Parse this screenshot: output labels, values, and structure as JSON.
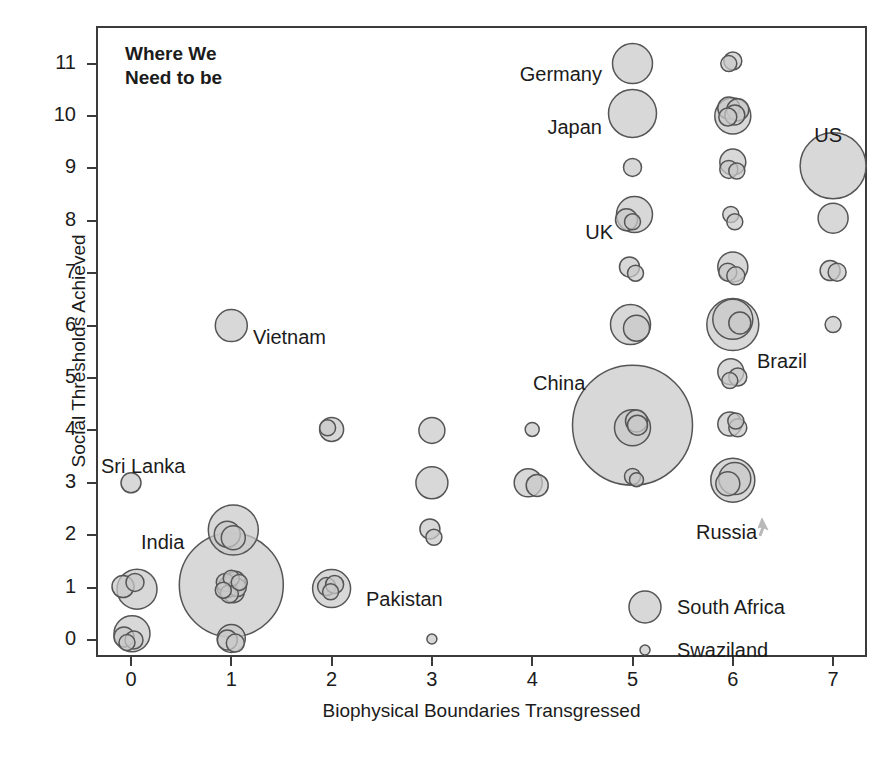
{
  "chart_data": {
    "type": "scatter",
    "title": "",
    "xlabel": "Biophysical Boundaries Transgressed",
    "ylabel": "Social Thresholds Achieved",
    "xlim": [
      -0.35,
      7.35
    ],
    "ylim": [
      -0.55,
      11.6
    ],
    "xticks": [
      0,
      1,
      2,
      3,
      4,
      5,
      6,
      7
    ],
    "yticks": [
      0,
      1,
      2,
      3,
      4,
      5,
      6,
      7,
      8,
      9,
      10,
      11
    ],
    "grid": false,
    "legend_position": "inside-bottom-right",
    "size_encoding": "population",
    "marker_fill": "#c9c9c9",
    "marker_stroke": "#555555",
    "marker_opacity": 0.72,
    "points": [
      {
        "label": "Sri Lanka",
        "x": 0,
        "y": 3,
        "r": 10
      },
      {
        "label": "",
        "x": -0.08,
        "y": 1.02,
        "r": 11
      },
      {
        "label": "",
        "x": 0.04,
        "y": 1.1,
        "r": 9
      },
      {
        "label": "",
        "x": 0.06,
        "y": 0.97,
        "r": 20
      },
      {
        "label": "",
        "x": -0.07,
        "y": 0.06,
        "r": 10
      },
      {
        "label": "",
        "x": 0.03,
        "y": 0.0,
        "r": 9
      },
      {
        "label": "",
        "x": 0.01,
        "y": 0.12,
        "r": 18
      },
      {
        "label": "",
        "x": -0.04,
        "y": -0.05,
        "r": 8
      },
      {
        "label": "Vietnam",
        "x": 1,
        "y": 6,
        "r": 16
      },
      {
        "label": "",
        "x": 1.02,
        "y": 2.1,
        "r": 25
      },
      {
        "label": "",
        "x": 0.96,
        "y": 2.02,
        "r": 13
      },
      {
        "label": "",
        "x": 1.02,
        "y": 1.95,
        "r": 12
      },
      {
        "label": "India",
        "x": 1.0,
        "y": 1.05,
        "r": 52
      },
      {
        "label": "",
        "x": 1.0,
        "y": 1.05,
        "r": 11
      },
      {
        "label": "",
        "x": 1.04,
        "y": 1.12,
        "r": 10
      },
      {
        "label": "",
        "x": 0.96,
        "y": 1.0,
        "r": 10
      },
      {
        "label": "",
        "x": 1.02,
        "y": 0.92,
        "r": 11
      },
      {
        "label": "",
        "x": 0.94,
        "y": 1.1,
        "r": 9
      },
      {
        "label": "",
        "x": 1.06,
        "y": 1.0,
        "r": 9
      },
      {
        "label": "",
        "x": 1.0,
        "y": 1.18,
        "r": 8
      },
      {
        "label": "",
        "x": 0.98,
        "y": 0.88,
        "r": 9
      },
      {
        "label": "",
        "x": 1.08,
        "y": 1.1,
        "r": 8
      },
      {
        "label": "",
        "x": 0.92,
        "y": 0.95,
        "r": 8
      },
      {
        "label": "",
        "x": 1.0,
        "y": 0.03,
        "r": 14
      },
      {
        "label": "",
        "x": 0.96,
        "y": 0.0,
        "r": 10
      },
      {
        "label": "",
        "x": 1.04,
        "y": -0.06,
        "r": 9
      },
      {
        "label": "",
        "x": 2,
        "y": 4.02,
        "r": 12
      },
      {
        "label": "",
        "x": 1.96,
        "y": 4.05,
        "r": 8
      },
      {
        "label": "Pakistan",
        "x": 2.0,
        "y": 0.98,
        "r": 19
      },
      {
        "label": "",
        "x": 1.95,
        "y": 1.02,
        "r": 9
      },
      {
        "label": "",
        "x": 2.03,
        "y": 1.06,
        "r": 9
      },
      {
        "label": "",
        "x": 1.99,
        "y": 0.92,
        "r": 8
      },
      {
        "label": "",
        "x": 3,
        "y": 4.0,
        "r": 13
      },
      {
        "label": "",
        "x": 3,
        "y": 3.0,
        "r": 16
      },
      {
        "label": "",
        "x": 2.98,
        "y": 2.12,
        "r": 10
      },
      {
        "label": "",
        "x": 3.02,
        "y": 1.96,
        "r": 8
      },
      {
        "label": "",
        "x": 3,
        "y": 0.02,
        "r": 5
      },
      {
        "label": "",
        "x": 4,
        "y": 4.02,
        "r": 7
      },
      {
        "label": "",
        "x": 3.96,
        "y": 3.0,
        "r": 14
      },
      {
        "label": "",
        "x": 4.05,
        "y": 2.95,
        "r": 11
      },
      {
        "label": "Germany",
        "x": 5,
        "y": 11.0,
        "r": 20
      },
      {
        "label": "Japan",
        "x": 5,
        "y": 10.05,
        "r": 24
      },
      {
        "label": "",
        "x": 5,
        "y": 9.02,
        "r": 9
      },
      {
        "label": "UK",
        "x": 5.02,
        "y": 8.12,
        "r": 18
      },
      {
        "label": "",
        "x": 4.94,
        "y": 8.02,
        "r": 11
      },
      {
        "label": "",
        "x": 5.0,
        "y": 7.98,
        "r": 8
      },
      {
        "label": "",
        "x": 4.97,
        "y": 7.12,
        "r": 10
      },
      {
        "label": "",
        "x": 5.03,
        "y": 7.0,
        "r": 8
      },
      {
        "label": "",
        "x": 4.98,
        "y": 6.02,
        "r": 20
      },
      {
        "label": "",
        "x": 5.04,
        "y": 5.95,
        "r": 13
      },
      {
        "label": "China",
        "x": 5.0,
        "y": 4.1,
        "r": 60
      },
      {
        "label": "",
        "x": 5.0,
        "y": 4.05,
        "r": 18
      },
      {
        "label": "",
        "x": 5.04,
        "y": 4.18,
        "r": 11
      },
      {
        "label": "",
        "x": 5.05,
        "y": 4.1,
        "r": 10
      },
      {
        "label": "",
        "x": 5.0,
        "y": 3.12,
        "r": 8
      },
      {
        "label": "",
        "x": 5.04,
        "y": 3.06,
        "r": 7
      },
      {
        "label": "",
        "x": 6.0,
        "y": 11.05,
        "r": 9
      },
      {
        "label": "",
        "x": 5.96,
        "y": 11.0,
        "r": 8
      },
      {
        "label": "",
        "x": 6.0,
        "y": 10.0,
        "r": 18
      },
      {
        "label": "",
        "x": 5.96,
        "y": 10.15,
        "r": 11
      },
      {
        "label": "",
        "x": 6.05,
        "y": 10.12,
        "r": 11
      },
      {
        "label": "",
        "x": 6.02,
        "y": 10.02,
        "r": 10
      },
      {
        "label": "",
        "x": 5.95,
        "y": 9.98,
        "r": 9
      },
      {
        "label": "",
        "x": 6.0,
        "y": 9.12,
        "r": 13
      },
      {
        "label": "",
        "x": 5.96,
        "y": 8.98,
        "r": 9
      },
      {
        "label": "",
        "x": 6.04,
        "y": 8.95,
        "r": 8
      },
      {
        "label": "",
        "x": 5.98,
        "y": 8.12,
        "r": 8
      },
      {
        "label": "",
        "x": 6.02,
        "y": 7.98,
        "r": 8
      },
      {
        "label": "",
        "x": 6.0,
        "y": 7.12,
        "r": 15
      },
      {
        "label": "",
        "x": 5.95,
        "y": 7.02,
        "r": 9
      },
      {
        "label": "",
        "x": 6.03,
        "y": 6.95,
        "r": 9
      },
      {
        "label": "Brazil",
        "x": 6.0,
        "y": 6.02,
        "r": 26
      },
      {
        "label": "",
        "x": 6.0,
        "y": 6.12,
        "r": 20
      },
      {
        "label": "",
        "x": 6.07,
        "y": 6.05,
        "r": 11
      },
      {
        "label": "",
        "x": 5.98,
        "y": 5.12,
        "r": 13
      },
      {
        "label": "",
        "x": 6.05,
        "y": 5.02,
        "r": 9
      },
      {
        "label": "",
        "x": 5.97,
        "y": 4.95,
        "r": 8
      },
      {
        "label": "",
        "x": 5.97,
        "y": 4.12,
        "r": 12
      },
      {
        "label": "",
        "x": 6.05,
        "y": 4.05,
        "r": 9
      },
      {
        "label": "",
        "x": 6.03,
        "y": 4.18,
        "r": 8
      },
      {
        "label": "Russia",
        "x": 6.0,
        "y": 3.05,
        "r": 22
      },
      {
        "label": "",
        "x": 6.02,
        "y": 3.08,
        "r": 16
      },
      {
        "label": "",
        "x": 5.95,
        "y": 2.98,
        "r": 12
      },
      {
        "label": "US",
        "x": 7.0,
        "y": 9.05,
        "r": 33
      },
      {
        "label": "",
        "x": 7.0,
        "y": 8.05,
        "r": 15
      },
      {
        "label": "",
        "x": 6.97,
        "y": 7.05,
        "r": 10
      },
      {
        "label": "",
        "x": 7.04,
        "y": 7.02,
        "r": 9
      },
      {
        "label": "",
        "x": 7.0,
        "y": 6.02,
        "r": 8
      }
    ]
  },
  "axes": {
    "x_title": "Biophysical Boundaries Transgressed",
    "y_title": "Social Thresholds Achieved",
    "x_ticks": [
      "0",
      "1",
      "2",
      "3",
      "4",
      "5",
      "6",
      "7"
    ],
    "y_ticks": [
      "0",
      "1",
      "2",
      "3",
      "4",
      "5",
      "6",
      "7",
      "8",
      "9",
      "10",
      "11"
    ]
  },
  "annotations": {
    "headline_line1": "Where We",
    "headline_line2": "Need to be",
    "labels": [
      {
        "text": "Germany",
        "x": 602,
        "y": 63,
        "align": "right"
      },
      {
        "text": "Japan",
        "x": 602,
        "y": 116,
        "align": "right"
      },
      {
        "text": "UK",
        "x": 613,
        "y": 221,
        "align": "right"
      },
      {
        "text": "US",
        "x": 842,
        "y": 124,
        "align": "right"
      },
      {
        "text": "Vietnam",
        "x": 253,
        "y": 326,
        "align": "left"
      },
      {
        "text": "Brazil",
        "x": 757,
        "y": 350,
        "align": "left"
      },
      {
        "text": "China",
        "x": 533,
        "y": 372,
        "align": "left"
      },
      {
        "text": "Sri Lanka",
        "x": 101,
        "y": 455,
        "align": "left"
      },
      {
        "text": "India",
        "x": 141,
        "y": 531,
        "align": "left"
      },
      {
        "text": "Pakistan",
        "x": 366,
        "y": 588,
        "align": "left"
      },
      {
        "text": "Russia",
        "x": 696,
        "y": 521,
        "align": "left"
      }
    ]
  },
  "legend": {
    "items": [
      {
        "label": "South Africa",
        "radius": 16,
        "x": 627,
        "y": 589
      },
      {
        "label": "Swaziland",
        "radius": 5,
        "x": 627,
        "y": 632
      }
    ]
  },
  "colors": {
    "marker_fill": "#c9c9c9",
    "marker_stroke": "#555555",
    "axis": "#3b3b3b",
    "text": "#1b1b1b",
    "background": "#ffffff"
  }
}
